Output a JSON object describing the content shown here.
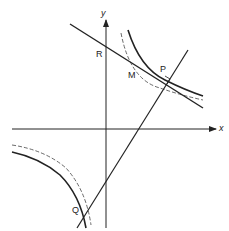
{
  "diagram": {
    "type": "rectangular-hyperbola-tangent-normal",
    "axes": {
      "x_label": "x",
      "y_label": "y"
    },
    "points": [
      {
        "name": "R",
        "label": "R"
      },
      {
        "name": "M",
        "label": "M"
      },
      {
        "name": "P",
        "label": "P"
      },
      {
        "name": "Q",
        "label": "Q"
      }
    ],
    "elements": [
      "solid hyperbola branches",
      "dashed hyperbola branches",
      "tangent at P through R and M",
      "normal at P through Q",
      "right-angle mark at P"
    ]
  }
}
